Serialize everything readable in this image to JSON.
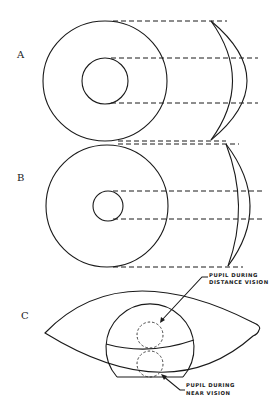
{
  "figure": {
    "panels": [
      {
        "id": "A",
        "label": "A"
      },
      {
        "id": "B",
        "label": "B"
      },
      {
        "id": "C",
        "label": "C"
      }
    ],
    "annotations": {
      "distance": {
        "line1": "PUPIL DURING",
        "line2": "DISTANCE VISION"
      },
      "near": {
        "line1": "PUPIL DURING",
        "line2": "NEAR VISION"
      }
    },
    "colors": {
      "ink": "#1a1a1a",
      "background": "#ffffff"
    }
  }
}
